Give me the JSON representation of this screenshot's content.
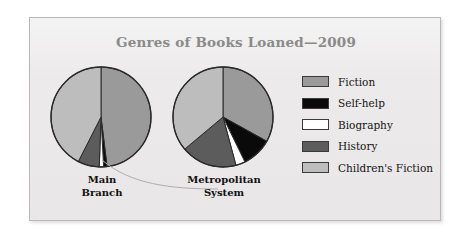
{
  "figure": {
    "title": "Genres of Books Loaned—2009",
    "title_color": "#8a8a8a",
    "panel_background": "#eceaea",
    "panel_border_color": "#b9b7b7"
  },
  "legend": {
    "position": "right",
    "items": [
      {
        "label": "Fiction",
        "color": "#9a9a9a"
      },
      {
        "label": "Self-help",
        "color": "#0a0a0a"
      },
      {
        "label": "Biography",
        "color": "#ffffff"
      },
      {
        "label": "History",
        "color": "#5c5c5c"
      },
      {
        "label": "Children's Fiction",
        "color": "#bdbdbd"
      }
    ]
  },
  "pies": [
    {
      "caption": "Main\nBranch"
    },
    {
      "caption": "Metropolitan\nSystem"
    }
  ],
  "chart_data": {
    "type": "pie",
    "title": "Genres of Books Loaned—2009",
    "xlabel": "",
    "ylabel": "",
    "units": "percent",
    "categories": [
      "Fiction",
      "Self-help",
      "Biography",
      "History",
      "Children's Fiction"
    ],
    "colors": [
      "#9a9a9a",
      "#0a0a0a",
      "#ffffff",
      "#5c5c5c",
      "#bdbdbd"
    ],
    "legend_position": "right",
    "grid": false,
    "start_angle_deg": 0,
    "direction": "clockwise",
    "series": [
      {
        "name": "Main Branch",
        "values": [
          48,
          1,
          1.5,
          7,
          42.5
        ],
        "angles_deg": [
          173,
          4,
          5,
          25,
          153
        ]
      },
      {
        "name": "Metropolitan System",
        "values": [
          33,
          10,
          3,
          18,
          36
        ],
        "angles_deg": [
          119,
          35,
          11,
          65,
          130
        ]
      }
    ]
  }
}
